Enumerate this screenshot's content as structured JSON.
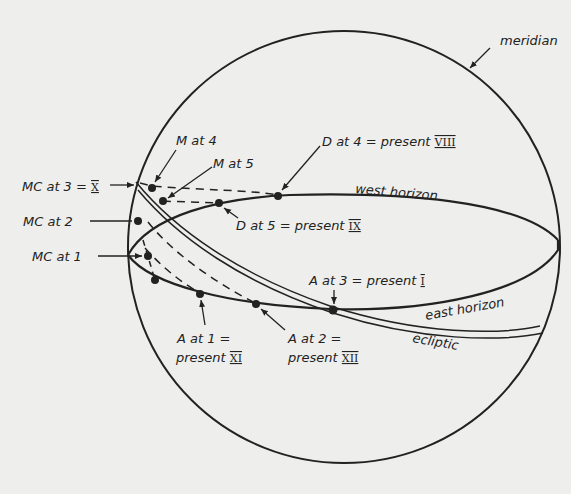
{
  "diagram": {
    "colors": {
      "background": "#eeeeec",
      "ink": "#222222"
    },
    "circles": {
      "meridian": "meridian"
    },
    "curves": {
      "west_horizon": "west horizon",
      "east_horizon": "east horizon",
      "ecliptic": "ecliptic"
    },
    "labels": {
      "meridian": "meridian",
      "west_horizon": "west horizon",
      "east_horizon": "east horizon",
      "ecliptic": "ecliptic",
      "mc_at_3": "MC at 3 =",
      "mc_at_3_roman": "X",
      "mc_at_2": "MC at 2",
      "mc_at_1": "MC at 1",
      "m_at_4": "M at 4",
      "m_at_5": "M at 5",
      "d_at_4": "D at 4 = present",
      "d_at_4_roman": "VIII",
      "d_at_5": "D at 5 = present",
      "d_at_5_roman": "IX",
      "a_at_3": "A at 3 = present",
      "a_at_3_roman": "I",
      "a_at_1_line1": "A at 1 =",
      "a_at_1_line2": "present",
      "a_at_1_roman": "XI",
      "a_at_2_line1": "A at 2 =",
      "a_at_2_line2": "present",
      "a_at_2_roman": "XII"
    }
  }
}
